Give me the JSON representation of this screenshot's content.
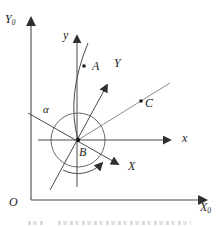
{
  "diagram": {
    "background": "#ffffff",
    "stroke_color": "#4a4a4a",
    "light_stroke_color": "#8c8c8c",
    "labels": {
      "fixed_y_axis": {
        "main": "Y",
        "sub": "0"
      },
      "fixed_x_axis": {
        "main": "X",
        "sub": "0"
      },
      "origin": "O",
      "body_y_axis": "y",
      "body_x_axis": "x",
      "rotated_y_axis": "Y",
      "rotated_x_axis": "X",
      "point_a": "A",
      "point_b": "B",
      "point_c": "C",
      "angle_alpha": "α"
    }
  }
}
